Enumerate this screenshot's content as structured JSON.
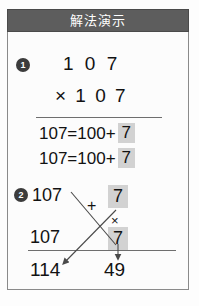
{
  "header": {
    "title": "解法演示"
  },
  "steps": [
    {
      "marker": "1"
    },
    {
      "marker": "2"
    }
  ],
  "problem": {
    "multiplicand": "1 0 7",
    "multiplier_line": "× 1 0 7"
  },
  "decomposition": [
    {
      "left": "107=100+",
      "highlight": "7"
    },
    {
      "left": "107=100+",
      "highlight": "7"
    }
  ],
  "work": {
    "top_number": "107",
    "bottom_number": "107",
    "plus_sign": "+",
    "times_sign": "×",
    "top_highlight": "7",
    "bottom_highlight": "7"
  },
  "results": {
    "left": "114",
    "right": "49"
  },
  "colors": {
    "header_bg": "#5d5d5d",
    "header_text": "#ffffff",
    "highlight_bg": "#d2d2d2",
    "ink": "#121212",
    "rule": "#6e6e6e",
    "bullet_bg": "#3c3c3c",
    "frame": "#8a8a8a",
    "page_bg": "#fdfdfd"
  },
  "icons": {
    "arrow_cross_left": "arrow-down-left-icon",
    "arrow_cross_right": "arrow-down-right-icon",
    "arrow_down": "arrow-down-icon"
  }
}
